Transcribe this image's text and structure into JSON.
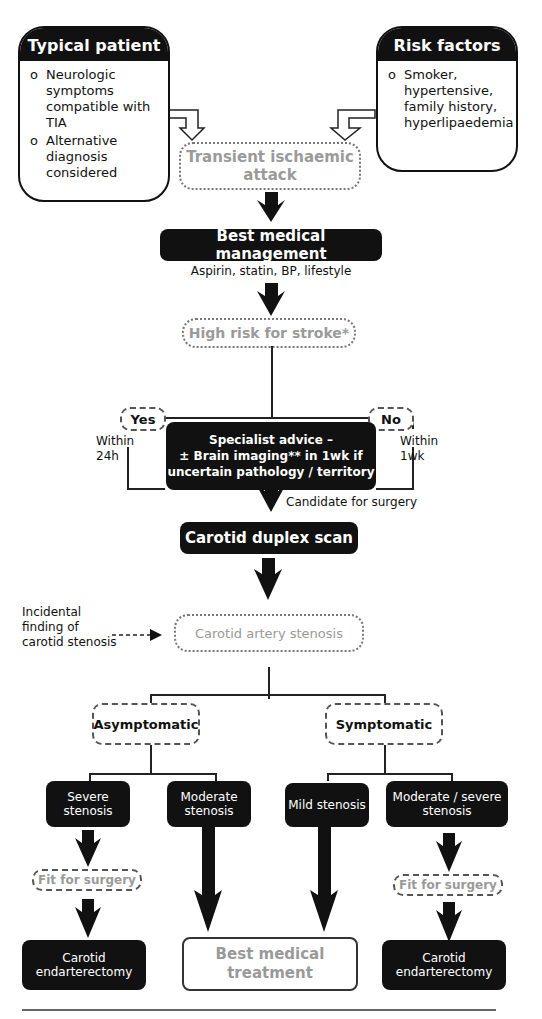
{
  "typical_patient": {
    "title": "Typical patient",
    "bullet": "o",
    "items": [
      "Neurologic symptoms compatible with TIA",
      "Alternative diagnosis considered"
    ]
  },
  "risk_factors": {
    "title": "Risk factors",
    "bullet": "o",
    "items": [
      "Smoker, hypertensive, family history, hyperlipaedemia"
    ]
  },
  "tia": {
    "label": "Transient ischaemic attack"
  },
  "best_medical_management": {
    "label": "Best medical management",
    "subtitle": "Aspirin, statin, BP, lifestyle"
  },
  "high_risk": {
    "label": "High risk for stroke*"
  },
  "yes_branch": {
    "label": "Yes",
    "note": "Within 24h"
  },
  "no_branch": {
    "label": "No",
    "note": "Within 1wk"
  },
  "specialist": {
    "line1": "Specialist advice –",
    "line2": "± Brain imaging** in 1wk if",
    "line3": "uncertain pathology / territory"
  },
  "candidate_label": "Candidate for surgery",
  "duplex": {
    "label": "Carotid duplex scan"
  },
  "incidental": {
    "label": "Incidental finding of carotid stenosis"
  },
  "stenosis": {
    "label": "Carotid artery stenosis"
  },
  "asymptomatic": {
    "label": "Asymptomatic"
  },
  "symptomatic": {
    "label": "Symptomatic"
  },
  "severe": {
    "label": "Severe stenosis"
  },
  "moderate": {
    "label": "Moderate stenosis"
  },
  "mild": {
    "label": "Mild stenosis"
  },
  "mod_severe": {
    "label": "Moderate / severe stenosis"
  },
  "fit_left": {
    "label": "Fit for surgery"
  },
  "fit_right": {
    "label": "Fit for surgery"
  },
  "cea_left": {
    "label": "Carotid endarterectomy"
  },
  "bmt": {
    "label": "Best medical treatment"
  },
  "cea_right": {
    "label": "Carotid endarterectomy"
  }
}
